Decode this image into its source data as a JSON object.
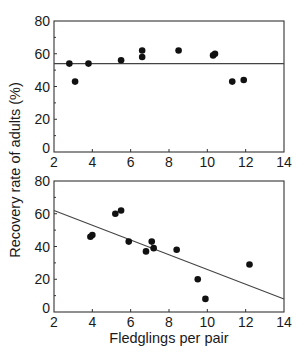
{
  "figure": {
    "ylabel": "Recovery rate of adults (%)",
    "xlabel": "Fledglings per pair"
  },
  "chart_data": [
    {
      "type": "scatter",
      "panel": "top",
      "title": "",
      "xlabel": "Fledglings per pair",
      "ylabel": "Recovery rate of adults (%)",
      "xlim": [
        2,
        14
      ],
      "ylim": [
        0,
        80
      ],
      "x_ticks": [
        2,
        4,
        6,
        8,
        10,
        12,
        14
      ],
      "y_ticks": [
        0,
        20,
        40,
        60,
        80
      ],
      "grid": false,
      "points": [
        {
          "x": 2.8,
          "y": 54
        },
        {
          "x": 3.1,
          "y": 43
        },
        {
          "x": 3.8,
          "y": 54
        },
        {
          "x": 5.5,
          "y": 56
        },
        {
          "x": 6.6,
          "y": 62
        },
        {
          "x": 6.6,
          "y": 58
        },
        {
          "x": 8.5,
          "y": 62
        },
        {
          "x": 10.3,
          "y": 59
        },
        {
          "x": 10.4,
          "y": 60
        },
        {
          "x": 11.3,
          "y": 43
        },
        {
          "x": 11.9,
          "y": 44
        }
      ],
      "fit_line": {
        "x": [
          2,
          14
        ],
        "y": [
          54,
          54
        ],
        "description": "horizontal mean line"
      }
    },
    {
      "type": "scatter",
      "panel": "bottom",
      "title": "",
      "xlabel": "Fledglings per pair",
      "ylabel": "Recovery rate of adults (%)",
      "xlim": [
        2,
        14
      ],
      "ylim": [
        0,
        80
      ],
      "x_ticks": [
        2,
        4,
        6,
        8,
        10,
        12,
        14
      ],
      "y_ticks": [
        0,
        20,
        40,
        60,
        80
      ],
      "grid": false,
      "points": [
        {
          "x": 3.9,
          "y": 46
        },
        {
          "x": 4.0,
          "y": 47
        },
        {
          "x": 5.2,
          "y": 60
        },
        {
          "x": 5.5,
          "y": 62
        },
        {
          "x": 5.9,
          "y": 43
        },
        {
          "x": 6.8,
          "y": 37
        },
        {
          "x": 7.1,
          "y": 43
        },
        {
          "x": 7.2,
          "y": 39
        },
        {
          "x": 8.4,
          "y": 38
        },
        {
          "x": 9.5,
          "y": 20
        },
        {
          "x": 9.9,
          "y": 8
        },
        {
          "x": 12.2,
          "y": 29
        }
      ],
      "fit_line": {
        "x": [
          2,
          14
        ],
        "y": [
          62,
          8
        ],
        "description": "linear regression line"
      }
    }
  ],
  "layout": {
    "panels": [
      {
        "left": 54,
        "right": 284,
        "top": 21,
        "bottom": 152
      },
      {
        "left": 54,
        "right": 284,
        "top": 181,
        "bottom": 312
      }
    ],
    "colors": {
      "ink": "#1a1a1a",
      "frame": "#333333",
      "line": "#444444"
    }
  }
}
